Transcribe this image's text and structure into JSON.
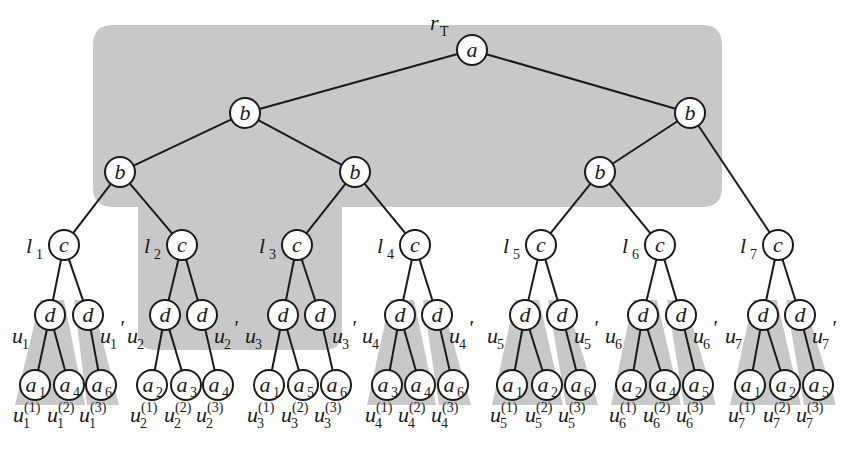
{
  "diagram": {
    "root_label": {
      "main": "r",
      "sub": "T"
    },
    "colors": {
      "shade": "#c8c8c8",
      "stroke": "#1a1a1a",
      "background": "#ffffff"
    },
    "nodes": {
      "root": {
        "label": "a",
        "x": 472,
        "y": 50
      },
      "b1": [
        {
          "label": "b",
          "x": 245,
          "y": 113
        },
        {
          "label": "b",
          "x": 690,
          "y": 113
        }
      ],
      "b2": [
        {
          "label": "b",
          "x": 120,
          "y": 172
        },
        {
          "label": "b",
          "x": 355,
          "y": 172
        },
        {
          "label": "b",
          "x": 600,
          "y": 172
        }
      ]
    },
    "subtrees": [
      {
        "l": "l",
        "l_sub": "1",
        "cx": 64,
        "d": [
          50,
          88
        ],
        "u": "u",
        "u_sub": "1",
        "leaves": [
          {
            "x": 35,
            "label": "a",
            "sub": "1"
          },
          {
            "x": 69,
            "label": "a",
            "sub": "4"
          },
          {
            "x": 101,
            "label": "a",
            "sub": "6"
          }
        ],
        "leaf_shaded": true
      },
      {
        "l": "l",
        "l_sub": "2",
        "cx": 182,
        "d": [
          165,
          202
        ],
        "u": "u",
        "u_sub": "2",
        "leaves": [
          {
            "x": 152,
            "label": "a",
            "sub": "2"
          },
          {
            "x": 186,
            "label": "a",
            "sub": "3"
          },
          {
            "x": 218,
            "label": "a",
            "sub": "4"
          }
        ],
        "leaf_shaded": false
      },
      {
        "l": "l",
        "l_sub": "3",
        "cx": 297,
        "d": [
          283,
          320
        ],
        "u": "u",
        "u_sub": "3",
        "leaves": [
          {
            "x": 269,
            "label": "a",
            "sub": "1"
          },
          {
            "x": 303,
            "label": "a",
            "sub": "5"
          },
          {
            "x": 336,
            "label": "a",
            "sub": "6"
          }
        ],
        "leaf_shaded": false
      },
      {
        "l": "l",
        "l_sub": "4",
        "cx": 415,
        "d": [
          400,
          437
        ],
        "u": "u",
        "u_sub": "4",
        "leaves": [
          {
            "x": 387,
            "label": "a",
            "sub": "3"
          },
          {
            "x": 420,
            "label": "a",
            "sub": "4"
          },
          {
            "x": 453,
            "label": "a",
            "sub": "6"
          }
        ],
        "leaf_shaded": true
      },
      {
        "l": "l",
        "l_sub": "5",
        "cx": 541,
        "d": [
          525,
          562
        ],
        "u": "u",
        "u_sub": "5",
        "leaves": [
          {
            "x": 512,
            "label": "a",
            "sub": "1"
          },
          {
            "x": 547,
            "label": "a",
            "sub": "2"
          },
          {
            "x": 580,
            "label": "a",
            "sub": "6"
          }
        ],
        "leaf_shaded": true
      },
      {
        "l": "l",
        "l_sub": "6",
        "cx": 660,
        "d": [
          643,
          681
        ],
        "u": "u",
        "u_sub": "6",
        "leaves": [
          {
            "x": 631,
            "label": "a",
            "sub": "2"
          },
          {
            "x": 665,
            "label": "a",
            "sub": "4"
          },
          {
            "x": 698,
            "label": "a",
            "sub": "5"
          }
        ],
        "leaf_shaded": true
      },
      {
        "l": "l",
        "l_sub": "7",
        "cx": 778,
        "d": [
          763,
          800
        ],
        "u": "u",
        "u_sub": "7",
        "leaves": [
          {
            "x": 750,
            "label": "a",
            "sub": "1"
          },
          {
            "x": 785,
            "label": "a",
            "sub": "2"
          },
          {
            "x": 818,
            "label": "a",
            "sub": "5"
          }
        ],
        "leaf_shaded": true
      }
    ],
    "level_y": {
      "c": 245,
      "d": 315,
      "leaf": 385,
      "bottom_labels": 420
    },
    "prime_mark": "'",
    "sup_labels": [
      "(1)",
      "(2)",
      "(3)"
    ]
  }
}
